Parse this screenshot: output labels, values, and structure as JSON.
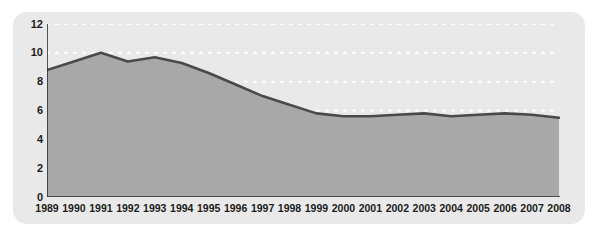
{
  "chart_data": {
    "type": "area",
    "title": "",
    "subtitle": "",
    "xlabel": "",
    "ylabel": "",
    "grid": true,
    "legend": null,
    "legend_position": "none",
    "ylim": [
      0,
      12
    ],
    "ytick_step": 2,
    "yticks": [
      "0",
      "2",
      "4",
      "6",
      "8",
      "10",
      "12"
    ],
    "categories": [
      "1989",
      "1990",
      "1991",
      "1992",
      "1993",
      "1994",
      "1995",
      "1996",
      "1997",
      "1998",
      "1999",
      "2000",
      "2001",
      "2002",
      "2003",
      "2004",
      "2005",
      "2006",
      "2007",
      "2008"
    ],
    "values": [
      8.8,
      9.4,
      10.0,
      9.4,
      9.7,
      9.3,
      8.6,
      7.8,
      7.0,
      6.4,
      5.8,
      5.6,
      5.6,
      5.7,
      5.8,
      5.6,
      5.7,
      5.8,
      5.7,
      5.5
    ],
    "series": [
      {
        "name": "series-1",
        "values": [
          8.8,
          9.4,
          10.0,
          9.4,
          9.7,
          9.3,
          8.6,
          7.8,
          7.0,
          6.4,
          5.8,
          5.6,
          5.6,
          5.7,
          5.8,
          5.6,
          5.7,
          5.8,
          5.7,
          5.5
        ]
      }
    ],
    "colors": {
      "panel_background": "#e9e9e9",
      "area_fill": "#a8a8a8",
      "line_stroke": "#4a4a4a",
      "gridline": "#ffffff",
      "axis": "#2b2b2b",
      "tick_label": "#1c1c1c",
      "page_background": "#ffffff"
    }
  }
}
